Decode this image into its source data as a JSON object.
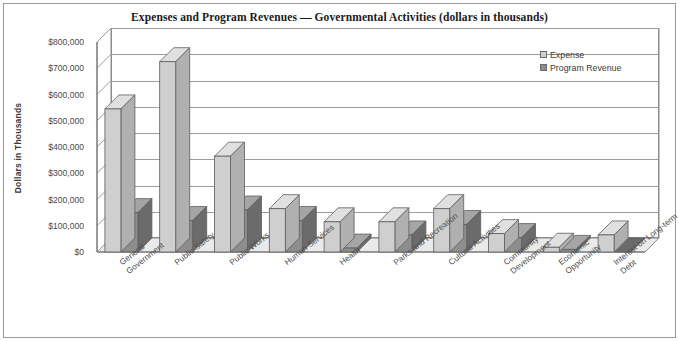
{
  "chart_data": {
    "type": "bar",
    "title": "Expenses and Program Revenues — Governmental Activities (dollars in thousands)",
    "xlabel": "",
    "ylabel": "Dollars in Thousands",
    "ylim": [
      0,
      800000
    ],
    "ytick_labels": [
      "$800,000",
      "$700,000",
      "$600,000",
      "$500,000",
      "$400,000",
      "$300,000",
      "$200,000",
      "$100,000",
      "$0"
    ],
    "ytick_values": [
      800000,
      700000,
      600000,
      500000,
      400000,
      300000,
      200000,
      100000,
      0
    ],
    "grid": true,
    "legend_position": "top-right",
    "style": "3d-clustered-column",
    "categories": [
      "General\nGovernment",
      "Public Safety",
      "Public Works",
      "Human Services",
      "Health",
      "Parks and Recreation",
      "Cultural Activities",
      "Community\nDevelopment",
      "Economic\nOpportunity",
      "Interest on Long-term\nDebt"
    ],
    "series": [
      {
        "name": "Expense",
        "color": "#cfcfcf",
        "values": [
          545000,
          725000,
          365000,
          165000,
          115000,
          115000,
          165000,
          70000,
          18000,
          65000
        ]
      },
      {
        "name": "Program Revenue",
        "color": "#8e8e8e",
        "values": [
          150000,
          120000,
          160000,
          120000,
          15000,
          65000,
          105000,
          55000,
          10000,
          0
        ]
      }
    ]
  },
  "legend": {
    "entries": [
      {
        "label": "Expense"
      },
      {
        "label": "Program Revenue"
      }
    ]
  },
  "colors": {
    "expense": "#cfcfcf",
    "program_revenue": "#8e8e8e",
    "frame": "#9a9a9a",
    "gridline": "#9d9d9d",
    "floor": "#e8e8e8",
    "text": "#3c3c3c"
  }
}
